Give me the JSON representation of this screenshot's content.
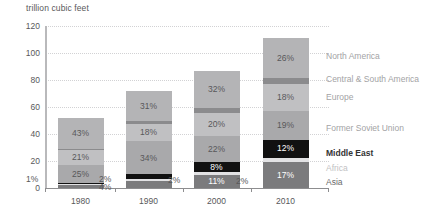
{
  "chart": {
    "axis_title": "trillion cubic feet",
    "ylabel": "trillion cubic feet",
    "yticks": [
      "0",
      "20",
      "40",
      "60",
      "80",
      "100",
      "120"
    ],
    "xticks": [
      "1980",
      "1990",
      "2000",
      "2010"
    ]
  },
  "legend": {
    "items": [
      {
        "label": "North America",
        "color": "#b4b4b6",
        "text_color": "#a3a3a5"
      },
      {
        "label": "Central & South America",
        "color": "#8b8b8d",
        "text_color": "#a3a3a5"
      },
      {
        "label": "Europe",
        "color": "#c0c0c2",
        "text_color": "#a3a3a5"
      },
      {
        "label": "Former Soviet Union",
        "color": "#a9a9ab",
        "text_color": "#a3a3a5"
      },
      {
        "label": "Middle East",
        "color": "#111111",
        "text_color": "#333333"
      },
      {
        "label": "Africa",
        "color": "#e2e2e4",
        "text_color": "#c2c2c4"
      },
      {
        "label": "Asia",
        "color": "#7b7b7d",
        "text_color": "#6a6a6c"
      }
    ]
  },
  "chart_data": {
    "type": "bar",
    "stacked": true,
    "title": "",
    "xlabel": "",
    "ylabel": "trillion cubic feet",
    "ylim": [
      0,
      120
    ],
    "yticks": [
      0,
      20,
      40,
      60,
      80,
      100,
      120
    ],
    "grid": true,
    "legend_position": "right",
    "categories": [
      "1980",
      "1990",
      "2000",
      "2010"
    ],
    "totals": [
      53,
      72,
      87,
      112
    ],
    "series": [
      {
        "name": "Asia",
        "color": "#7b7b7d",
        "values": [
          4,
          7,
          11,
          17
        ],
        "labels": [
          "4%",
          "7%",
          "11%",
          "17%"
        ]
      },
      {
        "name": "Africa",
        "color": "#e2e2e4",
        "values": [
          2,
          2,
          3,
          3
        ],
        "labels": [
          "2%",
          "2%",
          "3%",
          "3%"
        ]
      },
      {
        "name": "Middle East",
        "color": "#111111",
        "values": [
          1,
          5,
          8,
          12
        ],
        "labels": [
          "1%",
          "5%",
          "8%",
          "12%"
        ]
      },
      {
        "name": "Former Soviet Union",
        "color": "#a9a9ab",
        "values": [
          25,
          34,
          22,
          19
        ],
        "labels": [
          "25%",
          "34%",
          "22%",
          "19%"
        ]
      },
      {
        "name": "Europe",
        "color": "#c0c0c2",
        "values": [
          21,
          18,
          20,
          18
        ],
        "labels": [
          "21%",
          "18%",
          "20%",
          "18%"
        ]
      },
      {
        "name": "Central & South America",
        "color": "#8b8b8d",
        "values": [
          2,
          3,
          4,
          4
        ],
        "labels": [
          "2%",
          "3%",
          "4%",
          "4%"
        ]
      },
      {
        "name": "North America",
        "color": "#b4b4b6",
        "values": [
          43,
          31,
          32,
          26
        ],
        "labels": [
          "43%",
          "31%",
          "32%",
          "26%"
        ]
      }
    ]
  },
  "annotations": [
    {
      "name": "label-1980-middle-east-outside",
      "text": "1%"
    },
    {
      "name": "label-1980-africa-outside",
      "text": "2%"
    },
    {
      "name": "label-1980-asia-outside",
      "text": "4%"
    },
    {
      "name": "label-1990-africa-outside",
      "text": "2%"
    },
    {
      "name": "label-2000-africa-outside",
      "text": "2%"
    }
  ]
}
